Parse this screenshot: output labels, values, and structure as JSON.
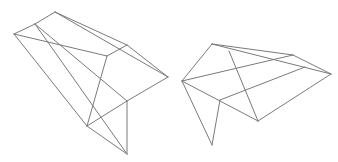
{
  "canvas": {
    "width": 338,
    "height": 162,
    "background": "#ffffff"
  },
  "style": {
    "stroke": "#7a7a7a",
    "stroke_width": 1
  },
  "shapes": [
    {
      "name": "wireframe-left",
      "vertices": {
        "A": [
          14,
          34
        ],
        "B": [
          35,
          24
        ],
        "C": [
          55,
          12
        ],
        "D": [
          127,
          45
        ],
        "E": [
          168,
          77
        ],
        "F": [
          107,
          56
        ],
        "G": [
          127,
          101
        ],
        "H": [
          87,
          126
        ],
        "I": [
          127,
          154
        ]
      },
      "edges": [
        [
          "A",
          "B"
        ],
        [
          "B",
          "C"
        ],
        [
          "C",
          "D"
        ],
        [
          "D",
          "E"
        ],
        [
          "C",
          "E"
        ],
        [
          "D",
          "F"
        ],
        [
          "A",
          "F"
        ],
        [
          "A",
          "H"
        ],
        [
          "B",
          "G"
        ],
        [
          "B",
          "I"
        ],
        [
          "F",
          "H"
        ],
        [
          "E",
          "G"
        ],
        [
          "G",
          "H"
        ],
        [
          "G",
          "I"
        ],
        [
          "H",
          "I"
        ]
      ]
    },
    {
      "name": "wireframe-right",
      "vertices": {
        "P": [
          212,
          44
        ],
        "Q": [
          182,
          81
        ],
        "R": [
          293,
          55
        ],
        "S": [
          331,
          74
        ],
        "T": [
          220,
          100
        ],
        "U": [
          258,
          121
        ],
        "V": [
          212,
          145
        ],
        "W": [
          305,
          67
        ],
        "X": [
          229,
          51
        ]
      },
      "edges": [
        [
          "P",
          "Q"
        ],
        [
          "P",
          "R"
        ],
        [
          "R",
          "S"
        ],
        [
          "P",
          "S"
        ],
        [
          "Q",
          "R"
        ],
        [
          "Q",
          "U"
        ],
        [
          "Q",
          "V"
        ],
        [
          "T",
          "V"
        ],
        [
          "T",
          "W"
        ],
        [
          "U",
          "S"
        ],
        [
          "X",
          "U"
        ]
      ]
    }
  ]
}
